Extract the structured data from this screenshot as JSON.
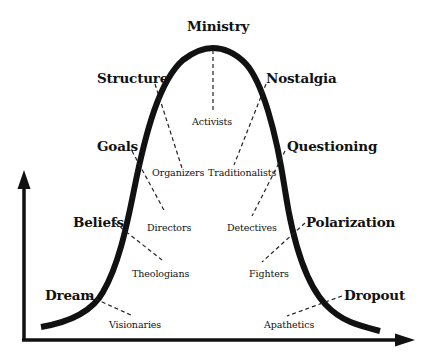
{
  "diagram": {
    "type": "bell-curve-lifecycle",
    "colors": {
      "curve": "#111111",
      "axis": "#111111",
      "leader": "#222222",
      "background": "#ffffff",
      "text": "#111111"
    },
    "axes": {
      "y_axis": "arrow-up",
      "x_axis": "arrow-right"
    },
    "stages": [
      {
        "id": "dream",
        "label": "Dream",
        "role": "Visionaries",
        "side": "rising"
      },
      {
        "id": "beliefs",
        "label": "Beliefs",
        "role": "Theologians",
        "side": "rising"
      },
      {
        "id": "goals",
        "label": "Goals",
        "role": "Directors",
        "side": "rising"
      },
      {
        "id": "structure",
        "label": "Structure",
        "role": "Organizers",
        "side": "rising"
      },
      {
        "id": "ministry",
        "label": "Ministry",
        "role": "Activists",
        "side": "peak"
      },
      {
        "id": "nostalgia",
        "label": "Nostalgia",
        "role": "Traditionalists",
        "side": "falling"
      },
      {
        "id": "questioning",
        "label": "Questioning",
        "role": "Detectives",
        "side": "falling"
      },
      {
        "id": "polarization",
        "label": "Polarization",
        "role": "Fighters",
        "side": "falling"
      },
      {
        "id": "dropout",
        "label": "Dropout",
        "role": "Apathetics",
        "side": "falling"
      }
    ]
  }
}
